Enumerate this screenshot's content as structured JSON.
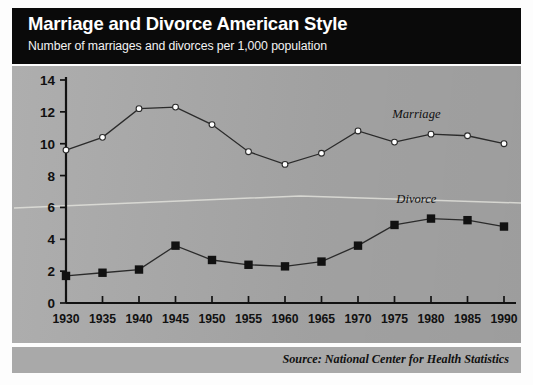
{
  "banner": {
    "title": "Marriage and Divorce American Style",
    "subtitle": "Number of marriages and divorces per 1,000 population"
  },
  "footer": {
    "source": "Source: National Center for Health Statistics"
  },
  "colors": {
    "banner_background": "#0a0a0a",
    "panel_background": "#a9a9a9",
    "axis": "#121212",
    "marriage_marker_fill": "#ffffff",
    "divorce_marker_fill": "#111111",
    "line": "#2b2b2b"
  },
  "chart_data": {
    "type": "line",
    "title": "Marriage and Divorce American Style",
    "subtitle": "Number of marriages and divorces per 1,000 population",
    "xlabel": "",
    "ylabel": "",
    "xlim": [
      1930,
      1990
    ],
    "ylim": [
      0,
      14
    ],
    "yticks": [
      0,
      2,
      4,
      6,
      8,
      10,
      12,
      14
    ],
    "grid": false,
    "legend": "inline-labels",
    "x": [
      1930,
      1935,
      1940,
      1945,
      1950,
      1955,
      1960,
      1965,
      1970,
      1975,
      1980,
      1985,
      1990
    ],
    "categories": [
      "1930",
      "1935",
      "1940",
      "1945",
      "1950",
      "1955",
      "1960",
      "1965",
      "1970",
      "1975",
      "1980",
      "1985",
      "1990"
    ],
    "series": [
      {
        "name": "Marriage",
        "marker": "circle-open-white",
        "values": [
          9.6,
          10.4,
          12.2,
          12.3,
          11.2,
          9.5,
          8.7,
          9.4,
          10.8,
          10.1,
          10.6,
          10.5,
          10.0
        ]
      },
      {
        "name": "Divorce",
        "marker": "square-filled-black",
        "values": [
          1.7,
          1.9,
          2.1,
          3.6,
          2.7,
          2.4,
          2.3,
          2.6,
          3.6,
          4.9,
          5.3,
          5.2,
          4.8
        ]
      }
    ],
    "annotations": [
      {
        "text": "Marriage",
        "x": 1978,
        "y": 11.6
      },
      {
        "text": "Divorce",
        "x": 1978,
        "y": 6.3
      }
    ]
  }
}
